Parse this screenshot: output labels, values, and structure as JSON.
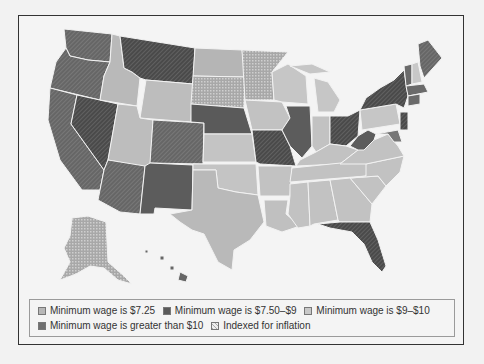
{
  "colors": {
    "background": "#f2f2f2",
    "wage_725": "#b7b7b7",
    "wage_750_9": "#5a5a5a",
    "wage_9_10": "#c8c8c8",
    "wage_gt10": "#6f6f6f",
    "indexed_pattern": "crosshatch"
  },
  "legend": {
    "items": [
      {
        "key": "wage_725",
        "label": "Minimum wage is $7.25"
      },
      {
        "key": "wage_750_9",
        "label": "Minimum wage is $7.50–$9"
      },
      {
        "key": "wage_9_10",
        "label": "Minimum wage is $9–$10"
      },
      {
        "key": "wage_gt10",
        "label": "Minimum wage is greater than $10"
      },
      {
        "key": "indexed",
        "label": "Indexed for inflation"
      }
    ]
  }
}
